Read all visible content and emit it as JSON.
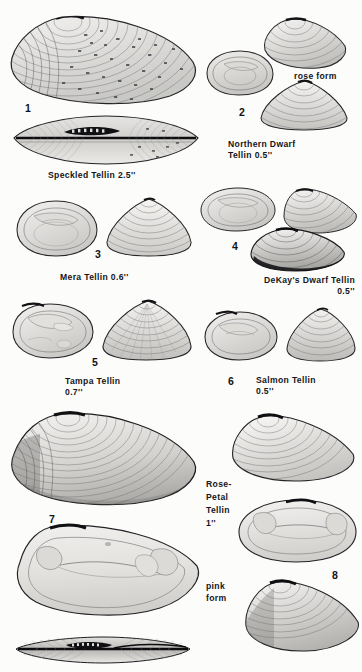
{
  "page": {
    "kind": "field-guide-plate",
    "background_color": "#fbfbfa",
    "ink_color": "#15151a"
  },
  "figures": [
    {
      "number": "1",
      "caption": "Speckled Tellin 2.5''",
      "views": [
        "exterior valve",
        "interior / hinge pair"
      ]
    },
    {
      "number": "2",
      "caption": "Northern Dwarf\nTellin 0.5''",
      "variant_label": "rose form",
      "views": [
        "interior valve",
        "rose form exterior",
        "exterior valve"
      ]
    },
    {
      "number": "3",
      "caption": "Mera Tellin 0.6''",
      "views": [
        "interior valve",
        "exterior valve"
      ]
    },
    {
      "number": "4",
      "caption": "DeKay's Dwarf Tellin\n0.5''",
      "views": [
        "interior valve",
        "exterior valve",
        "dark exterior valve"
      ]
    },
    {
      "number": "5",
      "caption": "Tampa Tellin\n0.7''",
      "views": [
        "interior valve",
        "exterior valve"
      ]
    },
    {
      "number": "6",
      "caption": "Salmon Tellin\n0.5''",
      "views": [
        "interior valve",
        "exterior valve"
      ]
    },
    {
      "number": "7",
      "caption": "",
      "views": [
        "exterior valve",
        "interior valve",
        "dorsal / hinge view"
      ]
    },
    {
      "number": "8",
      "caption": "Rose-\nPetal\nTellin\n1''",
      "variant_label": "pink\nform",
      "views": [
        "exterior valve",
        "interior valve",
        "pink form exterior"
      ]
    }
  ],
  "labels": {
    "fig1_caption": "Speckled Tellin 2.5''",
    "fig1_number": "1",
    "fig2_number": "2",
    "fig2_caption": "Northern Dwarf\nTellin 0.5''",
    "fig2_variant": "rose form",
    "fig3_number": "3",
    "fig3_caption": "Mera Tellin 0.6''",
    "fig4_number": "4",
    "fig4_caption": "DeKay's Dwarf Tellin\n0.5''",
    "fig5_number": "5",
    "fig5_caption": "Tampa Tellin\n0.7''",
    "fig6_number": "6",
    "fig6_caption": "Salmon Tellin\n0.5''",
    "fig7_number": "7",
    "fig8_number": "8",
    "fig8_caption": "Rose-\nPetal\nTellin\n1''",
    "fig8_variant": "pink\nform"
  }
}
